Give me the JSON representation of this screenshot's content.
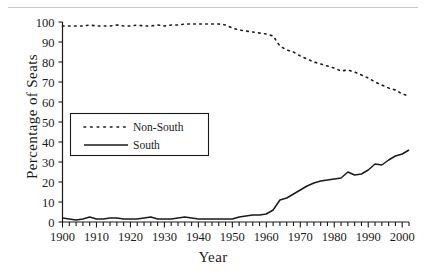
{
  "figure": {
    "y_axis_title": "Percentage of Seats",
    "x_axis_title": "Year"
  },
  "legend": {
    "items": [
      {
        "label": "Non-South",
        "style": "dotted",
        "color": "#1a1a1a"
      },
      {
        "label": "South",
        "style": "solid",
        "color": "#1a1a1a"
      }
    ]
  },
  "chart_data": {
    "type": "line",
    "title": "",
    "xlabel": "Year",
    "ylabel": "Percentage of Seats",
    "xlim": [
      1900,
      2002
    ],
    "ylim": [
      0,
      100
    ],
    "xticks": [
      1900,
      1910,
      1920,
      1930,
      1940,
      1950,
      1960,
      1970,
      1980,
      1990,
      2000
    ],
    "xtick_labels": [
      "1900",
      "1910",
      "1920",
      "1930",
      "1940",
      "1950",
      "1960",
      "1970",
      "1980",
      "1990",
      "2000"
    ],
    "minor_xtick_step": 2,
    "yticks": [
      0,
      10,
      20,
      30,
      40,
      50,
      60,
      70,
      80,
      90,
      100
    ],
    "ytick_labels": [
      "0",
      "10",
      "20",
      "30",
      "40",
      "50",
      "60",
      "70",
      "80",
      "90",
      "100"
    ],
    "grid": false,
    "legend_position": "center-left",
    "x": [
      1900,
      1902,
      1904,
      1906,
      1908,
      1910,
      1912,
      1914,
      1916,
      1918,
      1920,
      1922,
      1924,
      1926,
      1928,
      1930,
      1932,
      1934,
      1936,
      1938,
      1940,
      1942,
      1944,
      1946,
      1948,
      1950,
      1952,
      1954,
      1956,
      1958,
      1960,
      1962,
      1964,
      1966,
      1968,
      1970,
      1972,
      1974,
      1976,
      1978,
      1980,
      1982,
      1984,
      1986,
      1988,
      1990,
      1992,
      1994,
      1996,
      1998,
      2000,
      2002
    ],
    "series": [
      {
        "name": "Non-South",
        "style": "dotted",
        "color": "#1a1a1a",
        "values": [
          98,
          98,
          98,
          98,
          98.5,
          98,
          98,
          98,
          98.5,
          98,
          98,
          98.5,
          98,
          98,
          98.5,
          98,
          98.5,
          98.5,
          99,
          99,
          99,
          99,
          99,
          99,
          98.5,
          97,
          96,
          95.5,
          95,
          94.5,
          94,
          93,
          88,
          86,
          85,
          83,
          81.5,
          80,
          79,
          78,
          77,
          75.5,
          76,
          75,
          73.5,
          72,
          70,
          68.5,
          67,
          66,
          64,
          63
        ]
      },
      {
        "name": "South",
        "style": "solid",
        "color": "#1a1a1a",
        "values": [
          2,
          1.5,
          1,
          1.5,
          2.5,
          1.5,
          1.5,
          2,
          2,
          1.5,
          1.5,
          1.5,
          2,
          2.5,
          1.5,
          1.5,
          1.5,
          2,
          2.5,
          2,
          1.5,
          1.5,
          1.5,
          1.5,
          1.5,
          1.5,
          2.5,
          3,
          3.5,
          3.5,
          4,
          6,
          11,
          12,
          14,
          16,
          18,
          19.5,
          20.5,
          21,
          21.5,
          22,
          25,
          23.5,
          24,
          26,
          29,
          28.5,
          31,
          33,
          34,
          36
        ]
      }
    ]
  }
}
